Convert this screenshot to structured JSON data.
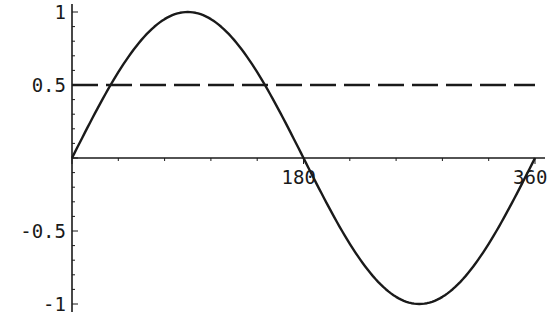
{
  "chart_data": {
    "type": "line",
    "title": "",
    "xlabel": "",
    "ylabel": "",
    "xlim": [
      0,
      360
    ],
    "ylim": [
      -1,
      1
    ],
    "grid": false,
    "legend": null,
    "x_ticks": [
      180,
      360
    ],
    "x_tick_labels": [
      "180",
      "360"
    ],
    "y_ticks": [
      1,
      0.5,
      -0.5,
      -1
    ],
    "y_tick_labels": [
      "1",
      "0.5",
      "-0.5",
      "-1"
    ],
    "series": [
      {
        "name": "sin(x)",
        "style": "solid",
        "function": "sin(x degrees)",
        "x": [
          0,
          30,
          60,
          90,
          120,
          150,
          180,
          210,
          240,
          270,
          300,
          330,
          360
        ],
        "values": [
          0,
          0.5,
          0.866,
          1,
          0.866,
          0.5,
          0,
          -0.5,
          -0.866,
          -1,
          -0.866,
          -0.5,
          0
        ]
      },
      {
        "name": "y = 0.5",
        "style": "dashed",
        "x": [
          0,
          360
        ],
        "values": [
          0.5,
          0.5
        ]
      }
    ]
  },
  "colors": {
    "curve": "#1a1a1a",
    "axes": "#1a1a1a",
    "background": "#ffffff"
  }
}
